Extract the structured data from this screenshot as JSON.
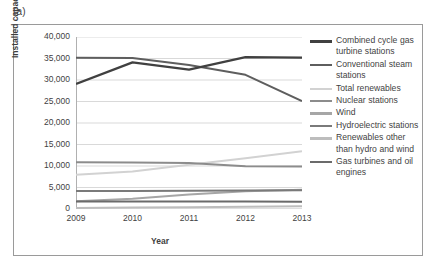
{
  "panel": {
    "label": "(a)"
  },
  "chart_data": {
    "type": "line",
    "title": "",
    "xlabel": "Year",
    "ylabel": "Installed capacity (MW)",
    "x": [
      "2009",
      "2010",
      "2011",
      "2012",
      "2013"
    ],
    "categories": [
      "2009",
      "2010",
      "2011",
      "2012",
      "2013"
    ],
    "xlim": [
      2009,
      2013
    ],
    "ylim": [
      0,
      40000
    ],
    "yticks": [
      "0",
      "5,000",
      "10,000",
      "15,000",
      "20,000",
      "25,000",
      "30,000",
      "35,000",
      "40,000"
    ],
    "ytick_values": [
      0,
      5000,
      10000,
      15000,
      20000,
      25000,
      30000,
      35000,
      40000
    ],
    "grid": "horizontal",
    "legend_position": "right",
    "series": [
      {
        "name": "Combined cycle gas turbine stations",
        "color": "#404040",
        "width": 2.3,
        "values": [
          29100,
          34100,
          32400,
          35300,
          35200
        ]
      },
      {
        "name": "Conventional steam stations",
        "color": "#5e5e5e",
        "width": 2.0,
        "values": [
          35200,
          35100,
          33500,
          31200,
          25100
        ]
      },
      {
        "name": "Total renewables",
        "color": "#d2d2d2",
        "width": 2.0,
        "values": [
          7950,
          8700,
          10300,
          11800,
          13450
        ]
      },
      {
        "name": "Nuclear stations",
        "color": "#8c8c8c",
        "width": 2.0,
        "values": [
          10850,
          10800,
          10700,
          9950,
          9900
        ]
      },
      {
        "name": "Wind",
        "color": "#a6a6a6",
        "width": 2.0,
        "values": [
          1800,
          2400,
          3400,
          4100,
          4500
        ]
      },
      {
        "name": "Hydroelectric stations",
        "color": "#7a7a7a",
        "width": 2.0,
        "values": [
          4200,
          4200,
          4250,
          4300,
          4350
        ]
      },
      {
        "name": "Renewables other than hydro and wind",
        "color": "#bdbdbd",
        "width": 2.0,
        "values": [
          250,
          320,
          420,
          520,
          640
        ]
      },
      {
        "name": "Gas turbines and oil engines",
        "color": "#6b6b6b",
        "width": 2.0,
        "values": [
          1750,
          1740,
          1730,
          1720,
          1700
        ]
      }
    ]
  }
}
